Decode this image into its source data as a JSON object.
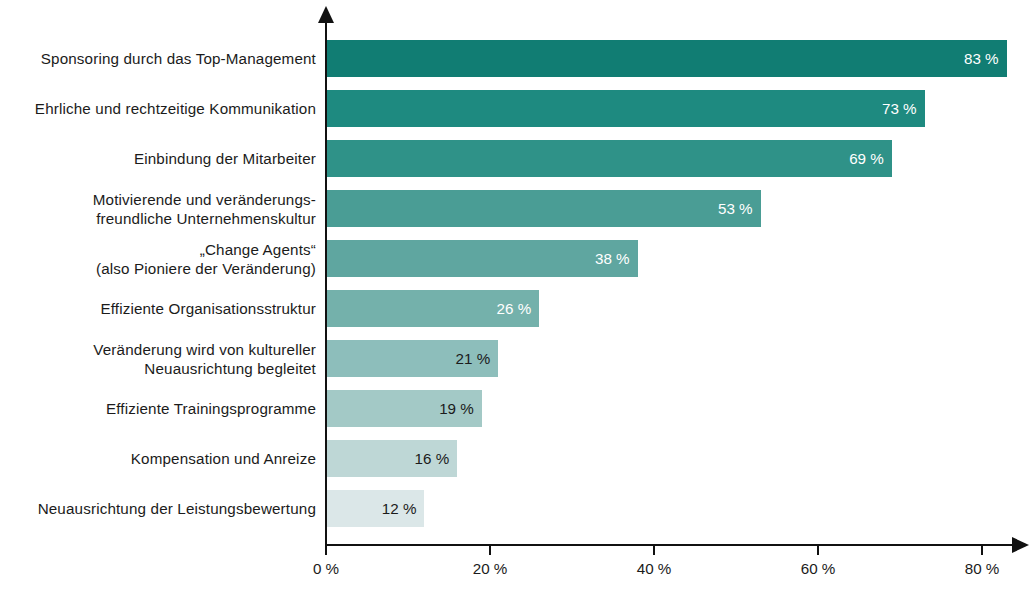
{
  "chart_data": {
    "type": "bar",
    "orientation": "horizontal",
    "title": "",
    "subtitle": "",
    "xlabel": "",
    "ylabel": "",
    "xlim": [
      0,
      84
    ],
    "grid": false,
    "legend": null,
    "value_suffix": " %",
    "categories": [
      "Sponsoring durch das Top-Management",
      "Ehrliche und rechtzeitige Kommunikation",
      "Einbindung der Mitarbeiter",
      "Motivierende und veränderungs-\nfreundliche Unternehmenskultur",
      "„Change Agents“\n(also Pioniere der Veränderung)",
      "Effiziente Organisationsstruktur",
      "Veränderung wird von kultureller\nNeuausrichtung begleitet",
      "Effiziente Trainingsprogramme",
      "Kompensation und Anreize",
      "Neuausrichtung der Leistungsbewertung"
    ],
    "values": [
      83,
      73,
      69,
      53,
      38,
      26,
      21,
      19,
      16,
      12
    ],
    "value_labels": [
      "83 %",
      "73 %",
      "69 %",
      "53 %",
      "38 %",
      "26 %",
      "21 %",
      "19 %",
      "16 %",
      "12 %"
    ],
    "bar_colors": [
      "#117d73",
      "#1e8a80",
      "#2f9288",
      "#4a9d95",
      "#5fa6a0",
      "#74b1ab",
      "#8dbebb",
      "#a3c9c6",
      "#bed7d6",
      "#dbe7e8"
    ],
    "value_label_colors": [
      "#ffffff",
      "#ffffff",
      "#ffffff",
      "#ffffff",
      "#ffffff",
      "#ffffff",
      "#1b1b1b",
      "#1b1b1b",
      "#1b1b1b",
      "#1b1b1b"
    ],
    "xticks": [
      0,
      20,
      40,
      60,
      80
    ],
    "xtick_labels": [
      "0 %",
      "20 %",
      "40 %",
      "60 %",
      "80 %"
    ],
    "axis_color": "#111111"
  }
}
